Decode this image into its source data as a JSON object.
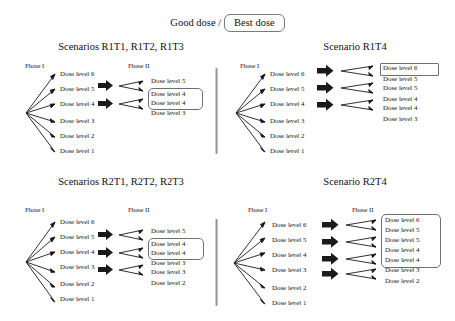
{
  "header": {
    "left_text": "Good dose /",
    "boxed_text": "Best dose"
  },
  "panels": [
    {
      "id": "r1t123",
      "title": "Scenarios R1T1, R1T2, R1T3",
      "phase1_caption": "Phase I",
      "phase2_caption": "Phase II",
      "phase1_doses": [
        "Dose level 6",
        "Dose level 5",
        "Dose level 4",
        "Dose level 3",
        "Dose level 2",
        "Dose level 1"
      ],
      "selected_count": 2,
      "phase2_doses": [
        "Dose level 5",
        "Dose level 4",
        "Dose level 4",
        "Dose level 3"
      ],
      "boxed_indices": [
        1,
        2
      ]
    },
    {
      "id": "r1t4",
      "title": "Scenario R1T4",
      "phase1_caption": "Phase I",
      "phase2_caption": "",
      "phase1_doses": [
        "Dose level 6",
        "Dose level 5",
        "Dose level 4",
        "Dose level 3",
        "Dose level 2",
        "Dose level 1"
      ],
      "selected_count": 3,
      "phase2_doses": [
        "Dose level 6",
        "Dose level 5",
        "Dose level 5",
        "Dose level 4",
        "Dose level 4",
        "Dose level 3"
      ],
      "boxed_indices": [
        0
      ]
    },
    {
      "id": "r2t123",
      "title": "Scenarios R2T1, R2T2, R2T3",
      "phase1_caption": "Phase I",
      "phase2_caption": "Phase II",
      "phase1_doses": [
        "Dose level 6",
        "Dose level 5",
        "Dose level 4",
        "Dose level 3",
        "Dose level 2",
        "Dose level 1"
      ],
      "selected_count": 3,
      "phase2_doses": [
        "Dose level 5",
        "Dose level 4",
        "Dose level 4",
        "Dose level 3",
        "Dose level 3",
        "Dose level 2"
      ],
      "boxed_indices": [
        1,
        2
      ]
    },
    {
      "id": "r2t4",
      "title": "Scenario R2T4",
      "phase1_caption": "Phase I",
      "phase2_caption": "Phase II",
      "phase1_doses": [
        "Dose level 6",
        "Dose level 5",
        "Dose level 4",
        "Dose level 3",
        "Dose level 2",
        "Dose level 1"
      ],
      "selected_count": 4,
      "phase2_doses": [
        "Dose level 6",
        "Dose level 5",
        "Dose level 5",
        "Dose level 4",
        "Dose level 4",
        "Dose level 3",
        "Dose level 2"
      ],
      "boxed_indices": [
        0,
        1,
        2,
        3,
        4
      ]
    }
  ],
  "colors": {
    "ink": "#111111",
    "arrow_block": "#1a1a1a",
    "box_border": "#6f6f6f",
    "divider": "#8e8e8e"
  }
}
